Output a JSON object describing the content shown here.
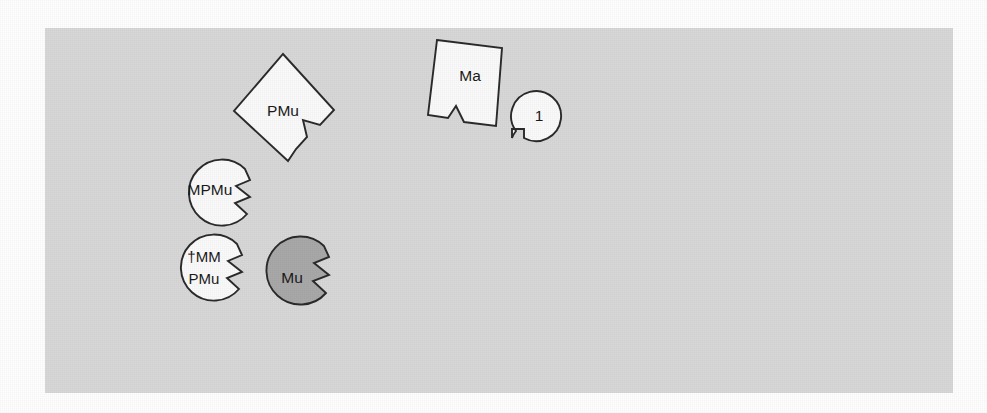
{
  "figure": {
    "name": "puzzle-piece-taxon-diagram",
    "background_color": "#ffffff",
    "panel": {
      "name": "diagram-panel",
      "fill_color": "#d9d9d9",
      "x": 45,
      "y": 28,
      "width": 908,
      "height": 365
    },
    "outline_color": "#2b2b2b",
    "pieces": [
      {
        "id": "pmu",
        "label": "PMu",
        "shape": "diamond-with-tab",
        "fill": "#fbfbfb",
        "label_x": 283,
        "label_y": 112
      },
      {
        "id": "ma",
        "label": "Ma",
        "shape": "rotated-square-with-v-notch",
        "fill": "#fbfbfb",
        "label_x": 470,
        "label_y": 77
      },
      {
        "id": "one",
        "label": "1",
        "shape": "circle-with-rect-notch",
        "fill": "#fbfbfb",
        "label_x": 539,
        "label_y": 117
      },
      {
        "id": "mpmu",
        "label": "MPMu",
        "shape": "circle-with-zigzag-notch",
        "fill": "#fbfbfb",
        "label_x": 212,
        "label_y": 191
      },
      {
        "id": "mmpmu",
        "label_line1": "†MM",
        "label_line2": "PMu",
        "shape": "circle-with-zigzag-notch",
        "fill": "#fbfbfb",
        "label_x": 207,
        "label_y": 267
      },
      {
        "id": "mu",
        "label": "Mu",
        "shape": "circle-with-zigzag-notch",
        "fill": "#a9a9a9",
        "label_x": 294,
        "label_y": 280
      }
    ]
  }
}
